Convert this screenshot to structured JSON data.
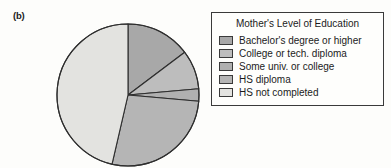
{
  "panel": {
    "label": "(b)"
  },
  "legend": {
    "title": "Mother's Level of Education"
  },
  "chart_data": {
    "type": "pie",
    "title": "Mother's Level of Education",
    "legend_position": "right",
    "start_angle_deg": 0,
    "direction": "clockwise",
    "categories": [
      "Bachelor's degree or higher",
      "College or tech. diploma",
      "Some univ. or college",
      "HS diploma",
      "HS not completed"
    ],
    "values": [
      14,
      9,
      3,
      28,
      46
    ],
    "units": "percent",
    "colors": [
      "#a8a8a8",
      "#bdbdbd",
      "#b0b0b0",
      "#b5b5b5",
      "#e3e3e0"
    ],
    "slices": [
      {
        "label": "Bachelor's degree or higher",
        "value": 14,
        "start_deg": 0,
        "end_deg": 53,
        "color": "#a8a8a8"
      },
      {
        "label": "College or tech. diploma",
        "value": 9,
        "start_deg": 53,
        "end_deg": 85,
        "color": "#bdbdbd"
      },
      {
        "label": "Some univ. or college",
        "value": 3,
        "start_deg": 85,
        "end_deg": 95,
        "color": "#b0b0b0"
      },
      {
        "label": "HS diploma",
        "value": 28,
        "start_deg": 95,
        "end_deg": 193,
        "color": "#b5b5b5"
      },
      {
        "label": "HS not completed",
        "value": 46,
        "start_deg": 193,
        "end_deg": 360,
        "color": "#e3e3e0"
      }
    ],
    "geometry": {
      "center_x": 128,
      "center_y": 95,
      "radius": 71
    },
    "stroke": "#2e2e2e"
  }
}
